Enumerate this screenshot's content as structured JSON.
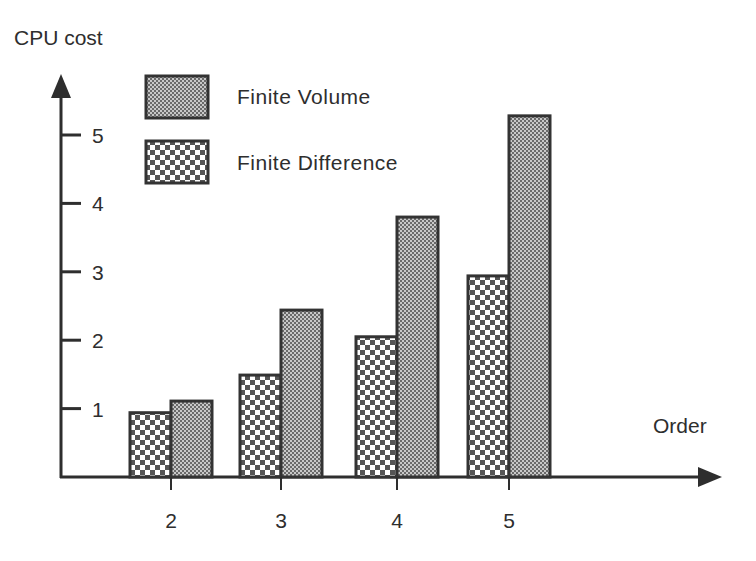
{
  "chart_data": {
    "type": "bar",
    "title": "",
    "xlabel": "Order",
    "ylabel": "CPU cost",
    "categories": [
      "2",
      "3",
      "4",
      "5"
    ],
    "yticks": [
      1,
      2,
      3,
      4,
      5
    ],
    "ylim": [
      0,
      5.9
    ],
    "grid": false,
    "legend_position": "top-left",
    "series": [
      {
        "name": "Finite Difference",
        "pattern": "coarse-checker",
        "values": [
          0.94,
          1.49,
          2.05,
          2.94
        ]
      },
      {
        "name": "Finite Volume",
        "pattern": "fine-checker",
        "values": [
          1.11,
          2.44,
          3.8,
          5.28
        ]
      }
    ],
    "legend_order": [
      "Finite Volume",
      "Finite Difference"
    ],
    "colors": {
      "axis": "#2e2e2e",
      "pattern_dark": "#5a5a5a",
      "pattern_light": "#ffffff",
      "bar_border": "#333333"
    }
  }
}
